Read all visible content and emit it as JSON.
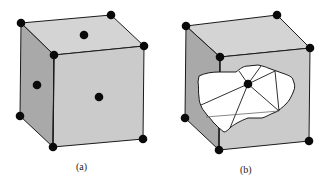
{
  "colors": {
    "top_face": "#d4d4d4",
    "left_face": "#a9a9a9",
    "front_face": "#cbcbcb",
    "edge": "#1a1a1a",
    "atom": "#0a0a0a",
    "cutout": "#ffffff",
    "background": "#ffffff"
  },
  "figure": {
    "panels": [
      {
        "id": "a",
        "caption": "(a)",
        "description": "Face-centered cubic unit cell with corner atoms and face-center atoms"
      },
      {
        "id": "b",
        "caption": "(b)",
        "description": "Same cube with front face cut away revealing interior atom and bonding lines"
      }
    ]
  }
}
